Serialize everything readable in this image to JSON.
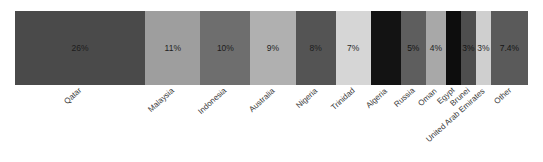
{
  "chart_data": {
    "type": "bar",
    "subtype": "stacked-bar-100-percent-horizontal",
    "title": "",
    "subtitle": "",
    "xlabel": "",
    "ylabel": "",
    "orientation": "horizontal",
    "grid": false,
    "legend": false,
    "legend_position": "none",
    "axis_range": [
      0,
      100
    ],
    "axis_units": "percent",
    "categories": [
      "Qatar",
      "Malaysia",
      "Indonesia",
      "Australia",
      "Nigeria",
      "Trinidad",
      "Algeria",
      "Russia",
      "Oman",
      "Egypt",
      "Brunei",
      "United Arab Emirates",
      "Other"
    ],
    "values": [
      26,
      11,
      10,
      9,
      8,
      7,
      6,
      5,
      4,
      3,
      3,
      3,
      7.4
    ],
    "data_labels": [
      "26%",
      "11%",
      "10%",
      "9%",
      "8%",
      "7%",
      "",
      "5%",
      "4%",
      "",
      "3%",
      "3%",
      "7.4%"
    ],
    "segment_colors": [
      "#4a4a4a",
      "#9e9e9e",
      "#6e6e6e",
      "#b0b0b0",
      "#545454",
      "#d6d6d6",
      "#131313",
      "#5e5e5e",
      "#a8a8a8",
      "#0d0d0d",
      "#4e4e4e",
      "#cfcfcf",
      "#5a5a5a"
    ],
    "segment_label_colors": [
      "#1c1c1c",
      "#1f1f1f",
      "#1c1c1c",
      "#1f1f1f",
      "#1c1c1c",
      "#2a2a2a",
      "#0a0a0a",
      "#141414",
      "#222222",
      "#070707",
      "#141414",
      "#2a2a2a",
      "#141414"
    ]
  },
  "style": {
    "background_color": "#ffffff",
    "axis_label_color": "#3a3a3a"
  }
}
